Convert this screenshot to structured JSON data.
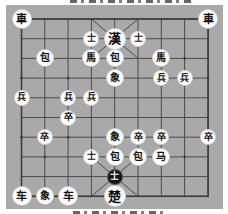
{
  "board": {
    "cols": 9,
    "rows": 10,
    "background": "#a9a9a9",
    "line_color": "#4a4a4a"
  },
  "sides": {
    "top": {
      "general": "漢"
    },
    "bottom": {
      "general": "楚"
    }
  },
  "selected": {
    "row": 8,
    "col": 4,
    "glyph": "士"
  },
  "pieces": [
    {
      "glyph": "車",
      "side": "top",
      "type": "chariot",
      "row": 0,
      "col": 0
    },
    {
      "glyph": "車",
      "side": "top",
      "type": "chariot",
      "row": 0,
      "col": 8
    },
    {
      "glyph": "士",
      "side": "top",
      "type": "advisor",
      "row": 1,
      "col": 3
    },
    {
      "glyph": "漢",
      "side": "top",
      "type": "general",
      "row": 1,
      "col": 4
    },
    {
      "glyph": "士",
      "side": "top",
      "type": "advisor",
      "row": 1,
      "col": 5
    },
    {
      "glyph": "包",
      "side": "top",
      "type": "cannon",
      "row": 2,
      "col": 1
    },
    {
      "glyph": "馬",
      "side": "top",
      "type": "horse",
      "row": 2,
      "col": 3
    },
    {
      "glyph": "包",
      "side": "top",
      "type": "cannon",
      "row": 2,
      "col": 4
    },
    {
      "glyph": "馬",
      "side": "top",
      "type": "horse",
      "row": 2,
      "col": 6
    },
    {
      "glyph": "象",
      "side": "top",
      "type": "elephant",
      "row": 3,
      "col": 4
    },
    {
      "glyph": "兵",
      "side": "top",
      "type": "soldier",
      "row": 3,
      "col": 6
    },
    {
      "glyph": "兵",
      "side": "top",
      "type": "soldier",
      "row": 3,
      "col": 7
    },
    {
      "glyph": "兵",
      "side": "top",
      "type": "soldier",
      "row": 4,
      "col": 0
    },
    {
      "glyph": "兵",
      "side": "top",
      "type": "soldier",
      "row": 4,
      "col": 2
    },
    {
      "glyph": "兵",
      "side": "top",
      "type": "soldier",
      "row": 4,
      "col": 3
    },
    {
      "glyph": "卒",
      "side": "bottom",
      "type": "soldier",
      "row": 5,
      "col": 2
    },
    {
      "glyph": "卒",
      "side": "bottom",
      "type": "soldier",
      "row": 6,
      "col": 1
    },
    {
      "glyph": "象",
      "side": "bottom",
      "type": "elephant",
      "row": 6,
      "col": 4
    },
    {
      "glyph": "卒",
      "side": "bottom",
      "type": "soldier",
      "row": 6,
      "col": 5
    },
    {
      "glyph": "卒",
      "side": "bottom",
      "type": "soldier",
      "row": 6,
      "col": 6
    },
    {
      "glyph": "卒",
      "side": "bottom",
      "type": "soldier",
      "row": 6,
      "col": 8
    },
    {
      "glyph": "士",
      "side": "bottom",
      "type": "advisor",
      "row": 7,
      "col": 3
    },
    {
      "glyph": "包",
      "side": "bottom",
      "type": "cannon",
      "row": 7,
      "col": 4
    },
    {
      "glyph": "包",
      "side": "bottom",
      "type": "cannon",
      "row": 7,
      "col": 5
    },
    {
      "glyph": "马",
      "side": "bottom",
      "type": "horse",
      "row": 7,
      "col": 6
    },
    {
      "glyph": "士",
      "side": "bottom",
      "type": "advisor",
      "row": 8,
      "col": 4,
      "selected": true
    },
    {
      "glyph": "车",
      "side": "bottom",
      "type": "chariot",
      "row": 9,
      "col": 0
    },
    {
      "glyph": "象",
      "side": "bottom",
      "type": "elephant",
      "row": 9,
      "col": 1
    },
    {
      "glyph": "车",
      "side": "bottom",
      "type": "chariot",
      "row": 9,
      "col": 2
    },
    {
      "glyph": "楚",
      "side": "bottom",
      "type": "general",
      "row": 9,
      "col": 4
    }
  ]
}
